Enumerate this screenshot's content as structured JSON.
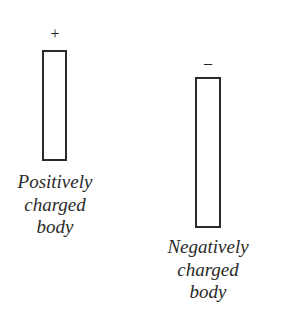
{
  "diagram": {
    "positive_body": {
      "sign": "+",
      "label_lines": [
        "Positively",
        "charged",
        "body"
      ]
    },
    "negative_body": {
      "sign": "–",
      "label_lines": [
        "Negatively",
        "charged",
        "body"
      ]
    }
  }
}
